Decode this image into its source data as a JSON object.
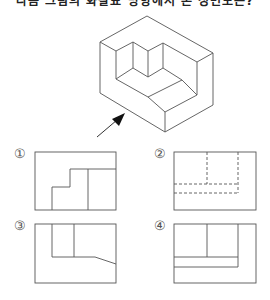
{
  "header": {
    "text": "다음 그림의 화살표 방향에서 본 정면도는?"
  },
  "figure": {
    "type": "isometric-drawing",
    "view_arrow": "front-left, pointing up-right"
  },
  "options": [
    {
      "label": "①"
    },
    {
      "label": "②"
    },
    {
      "label": "③"
    },
    {
      "label": "④"
    }
  ],
  "colors": {
    "line": "#555555",
    "arrow": "#111111",
    "background": "#ffffff"
  }
}
